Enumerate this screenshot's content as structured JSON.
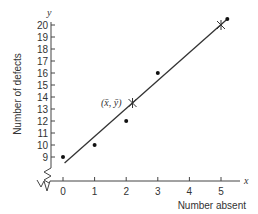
{
  "chart_data": {
    "type": "scatter",
    "title": "",
    "xlabel": "Number absent",
    "ylabel": "Number of defects",
    "x_axis_var": "x",
    "y_axis_var": "y",
    "x_ticks": [
      "0",
      "1",
      "2",
      "3",
      "4",
      "5"
    ],
    "y_ticks": [
      "9",
      "10",
      "11",
      "12",
      "13",
      "14",
      "15",
      "16",
      "17",
      "18",
      "19",
      "20"
    ],
    "xlim": [
      0,
      5.3
    ],
    "ylim": [
      8,
      20.7
    ],
    "axis_break": true,
    "grid": false,
    "series": [
      {
        "name": "data",
        "marker": "dot",
        "points": [
          {
            "x": 0,
            "y": 9
          },
          {
            "x": 1,
            "y": 10
          },
          {
            "x": 2,
            "y": 12
          },
          {
            "x": 3,
            "y": 16
          },
          {
            "x": 5.2,
            "y": 20.5
          }
        ]
      }
    ],
    "regression_line": {
      "start": {
        "x": 0.05,
        "y": 8.5
      },
      "end": {
        "x": 5.2,
        "y": 20.5
      }
    },
    "crosses": [
      {
        "x": 2.2,
        "y": 13.5,
        "label": "(x̄, ȳ)"
      },
      {
        "x": 5,
        "y": 20,
        "label": ""
      }
    ],
    "annotation": "(x̄, ȳ)"
  }
}
